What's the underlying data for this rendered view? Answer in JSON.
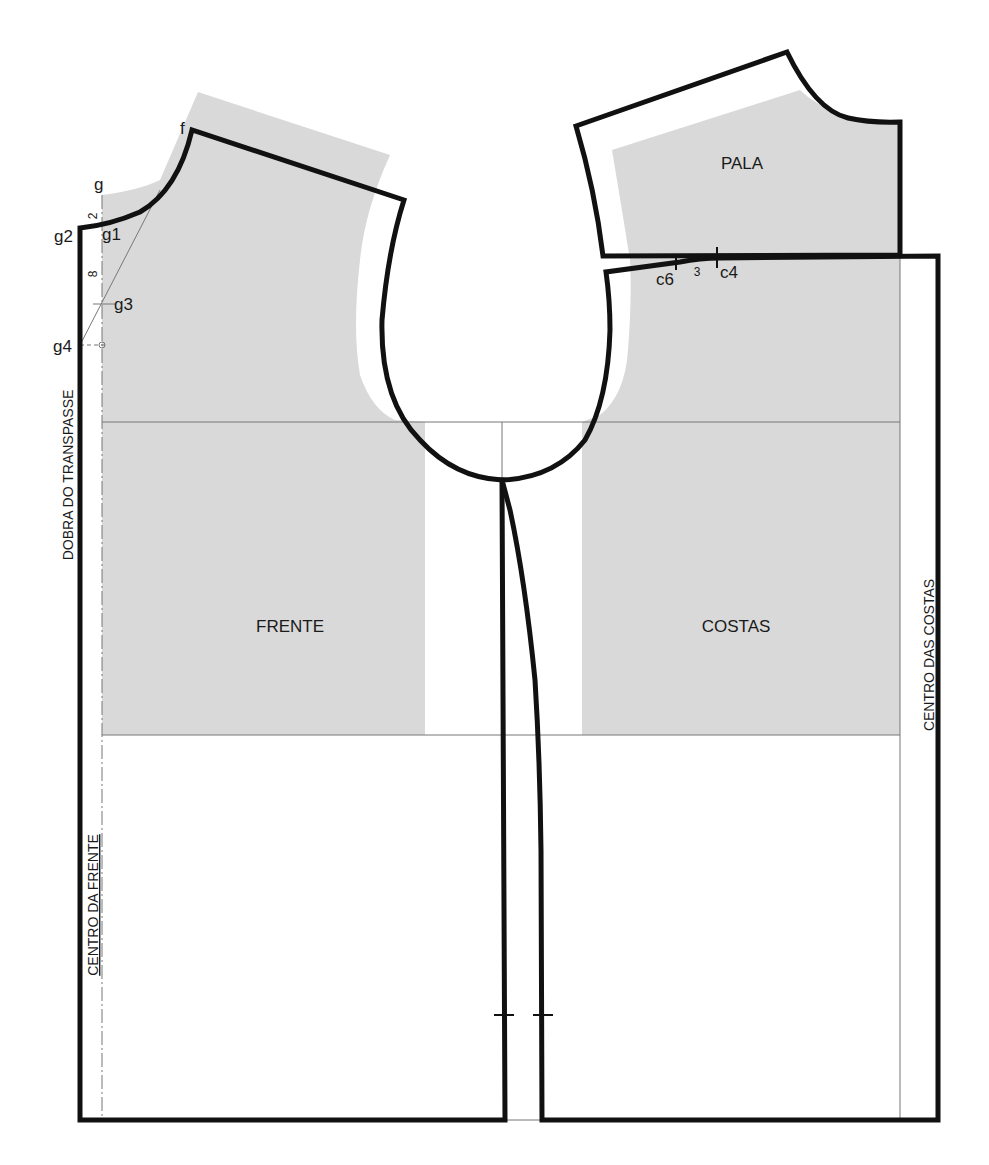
{
  "diagram": {
    "type": "sewing-pattern",
    "colors": {
      "fill": "#d9d9d9",
      "outline": "#111111",
      "guide": "#777777"
    },
    "pieces": [
      {
        "name": "front",
        "label": "FRENTE"
      },
      {
        "name": "back",
        "label": "COSTAS"
      },
      {
        "name": "yoke",
        "label": "PALA"
      }
    ],
    "vertical_labels": {
      "front_fold": "DOBRA DO TRANSPASSE",
      "center_front": "CENTRO DA FRENTE",
      "center_back": "CENTRO DAS COSTAS"
    },
    "points": {
      "f": "f",
      "g": "g",
      "g1": "g1",
      "g2": "g2",
      "g3": "g3",
      "g4": "g4",
      "c4": "c4",
      "c6": "c6"
    },
    "measurements": {
      "g_to_g1": "2",
      "g1_to_g3": "8",
      "c6_to_c4": "3"
    }
  }
}
